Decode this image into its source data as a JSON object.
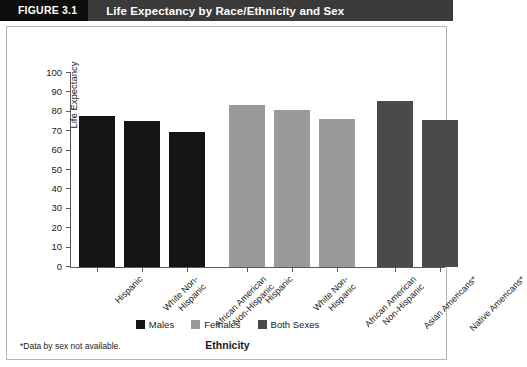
{
  "header": {
    "figure_tag": "FIGURE 3.1",
    "title": "Life Expectancy by Race/Ethnicity and Sex"
  },
  "footnote": "*Data by sex not available.",
  "colors": {
    "males": "#141414",
    "females": "#9a9a9a",
    "both_sexes": "#4a4a4a",
    "header_bar": "#3a3a3a",
    "header_tag": "#0d0d0d",
    "axis": "#5a5a5a",
    "frame": "#b4b4b4"
  },
  "chart_data": {
    "type": "bar",
    "title": "Life Expectancy by Race/Ethnicity and Sex",
    "xlabel": "Ethnicity",
    "ylabel": "Life Expectancy",
    "ylim": [
      0,
      100
    ],
    "yticks": [
      0,
      10,
      20,
      30,
      40,
      50,
      60,
      70,
      80,
      90,
      100
    ],
    "ytick_labels": [
      "0",
      "10",
      "20",
      "30",
      "40",
      "50",
      "60",
      "70",
      "80",
      "90",
      "100"
    ],
    "grid": false,
    "legend_position": "bottom-center",
    "legend": [
      "Males",
      "Females",
      "Both Sexes"
    ],
    "bars": [
      {
        "label": "Hispanic",
        "series": "Males",
        "value": 78.0
      },
      {
        "label": "White Non-Hispanic",
        "series": "Males",
        "value": 75.5
      },
      {
        "label": "African American Non-Hispanic",
        "series": "Males",
        "value": 69.5
      },
      {
        "label": "Hispanic",
        "series": "Females",
        "value": 83.5
      },
      {
        "label": "White Non-Hispanic",
        "series": "Females",
        "value": 81.0
      },
      {
        "label": "African American Non-Hispanic",
        "series": "Females",
        "value": 76.5
      },
      {
        "label": "Asian Americans*",
        "series": "Both Sexes",
        "value": 85.5
      },
      {
        "label": "Native Americans*",
        "series": "Both Sexes",
        "value": 76.0
      }
    ],
    "categories": [
      "Hispanic",
      "White Non-Hispanic",
      "African American Non-Hispanic",
      "Hispanic",
      "White Non-Hispanic",
      "African American Non-Hispanic",
      "Asian Americans*",
      "Native Americans*"
    ],
    "values": [
      78.0,
      75.5,
      69.5,
      83.5,
      81.0,
      76.5,
      85.5,
      76.0
    ],
    "category_lines": [
      [
        "Hispanic"
      ],
      [
        "White Non-",
        "Hispanic"
      ],
      [
        "African American",
        "Non-Hispanic"
      ],
      [
        "Hispanic"
      ],
      [
        "White Non-",
        "Hispanic"
      ],
      [
        "African American",
        "Non-Hispanic"
      ],
      [
        "Asian Americans*"
      ],
      [
        "Native Americans*"
      ]
    ]
  }
}
